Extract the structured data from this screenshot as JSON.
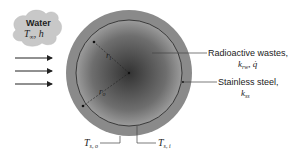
{
  "diagram": {
    "water_label": {
      "title": "Water",
      "params_T": "T",
      "params_T_sub": "∞",
      "params_sep": ", ",
      "params_h": "h"
    },
    "radioactive_label": {
      "line1": "Radioactive wastes,",
      "k": "k",
      "k_sub": "rw",
      "sep": ", ",
      "q": "q̇"
    },
    "steel_label": {
      "line1": "Stainless steel,",
      "k": "k",
      "k_sub": "ss"
    },
    "radius_inner": {
      "r": "r",
      "sub": "i"
    },
    "radius_outer": {
      "r": "r",
      "sub": "o"
    },
    "ts_outer": {
      "T": "T",
      "sub": "s, o"
    },
    "ts_inner": {
      "T": "T",
      "sub": "s, i"
    },
    "colors": {
      "shell": "#8a8a8a",
      "core_center": "#3a3a3a",
      "core_edge": "#9a9a9a",
      "cloud": "#c8c8c8",
      "line": "#333333"
    },
    "flow_arrows": 3
  }
}
